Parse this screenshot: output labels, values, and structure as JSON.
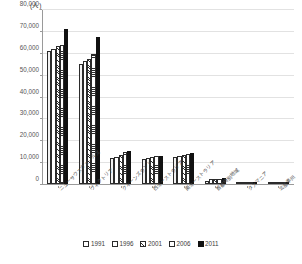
{
  "chart_data": {
    "type": "bar",
    "title": "",
    "unit_label": "(人)",
    "xlabel": "",
    "ylabel": "",
    "ylim": [
      0,
      80000
    ],
    "ytick_values": [
      0,
      10000,
      20000,
      30000,
      40000,
      50000,
      60000,
      70000,
      80000
    ],
    "ytick_labels": [
      "0",
      "10,000",
      "20,000",
      "30,000",
      "40,000",
      "50,000",
      "60,000",
      "70,000",
      "80,000"
    ],
    "grid": true,
    "legend_position": "bottom",
    "categories": [
      "ニューサウスウェールズ",
      "ヴィクトリア",
      "クイーンズランド",
      "西オーストラリア",
      "南オーストラリア",
      "首都特別地域",
      "タスマニア",
      "北部準州"
    ],
    "series": [
      {
        "name": "1991",
        "pattern": "empty",
        "values": [
          61000,
          55000,
          11800,
          11600,
          12600,
          1400,
          260,
          120
        ]
      },
      {
        "name": "1996",
        "pattern": "dotted",
        "values": [
          62200,
          56500,
          12300,
          12000,
          13000,
          2100,
          280,
          130
        ]
      },
      {
        "name": "2001",
        "pattern": "hatch",
        "values": [
          63500,
          57500,
          13200,
          12400,
          13400,
          2300,
          300,
          140
        ]
      },
      {
        "name": "2006",
        "pattern": "horizontal",
        "values": [
          64000,
          59800,
          14700,
          12700,
          13600,
          2400,
          320,
          150
        ]
      },
      {
        "name": "2011",
        "pattern": "solid",
        "values": [
          71200,
          67500,
          15300,
          13100,
          14100,
          2600,
          340,
          160
        ]
      }
    ]
  },
  "legend": {
    "entries": [
      {
        "label": "1991",
        "pattern": "p1991"
      },
      {
        "label": "1996",
        "pattern": "p1996"
      },
      {
        "label": "2001",
        "pattern": "p2001"
      },
      {
        "label": "2006",
        "pattern": "p2006"
      },
      {
        "label": "2011",
        "pattern": "p2011"
      }
    ]
  }
}
